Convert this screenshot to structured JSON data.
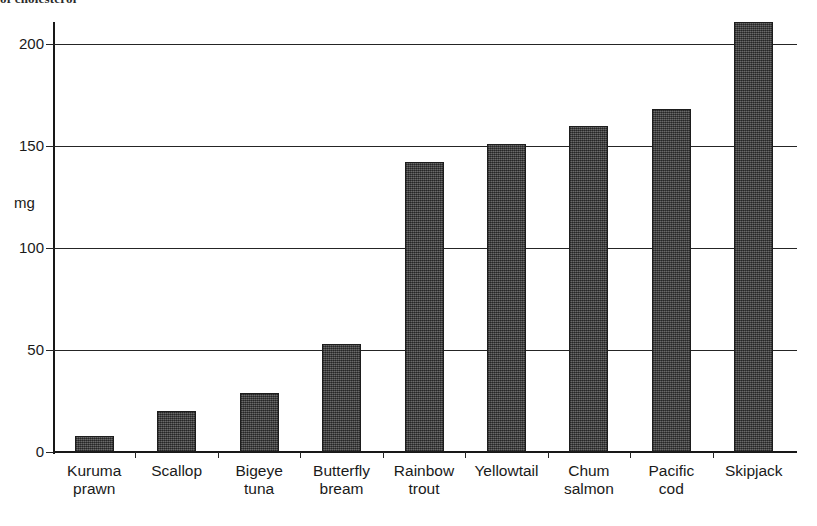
{
  "top_caption": "of cholesterol",
  "chart_data": {
    "type": "bar",
    "title": "",
    "xlabel": "",
    "ylabel": "mg",
    "unit_label": "mg",
    "categories": [
      "Kuruma prawn",
      "Scallop",
      "Bigeye tuna",
      "Butterfly bream",
      "Rainbow trout",
      "Yellowtail",
      "Chum salmon",
      "Pacific cod",
      "Skipjack"
    ],
    "category_lines": [
      [
        "Kuruma",
        "prawn"
      ],
      [
        "Scallop",
        ""
      ],
      [
        "Bigeye",
        "tuna"
      ],
      [
        "Butterfly",
        "bream"
      ],
      [
        "Rainbow",
        "trout"
      ],
      [
        "Yellowtail",
        ""
      ],
      [
        "Chum",
        "salmon"
      ],
      [
        "Pacific",
        "cod"
      ],
      [
        "Skipjack",
        ""
      ]
    ],
    "values": [
      8,
      20,
      29,
      53,
      142,
      151,
      160,
      168,
      211
    ],
    "ylim": [
      0,
      215
    ],
    "yticks": [
      0,
      50,
      100,
      150,
      200
    ],
    "ytick_labels": [
      "0",
      "50",
      "100",
      "150",
      "200"
    ],
    "grid": true,
    "legend": "none",
    "bar_color": "#4a4a4a",
    "bar_border_color": "#1d1d1d",
    "axis_color": "#181818"
  }
}
